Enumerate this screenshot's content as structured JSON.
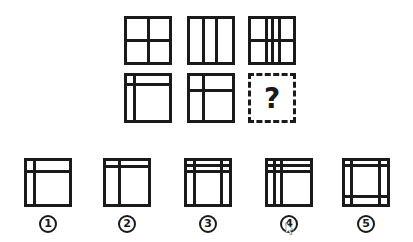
{
  "puzzle": {
    "question_mark": "?",
    "grid": [
      {
        "id": "r1c1",
        "box": [
          124,
          16,
          48,
          49
        ],
        "vlines": [
          0.5
        ],
        "hlines": [
          0.5
        ]
      },
      {
        "id": "r1c2",
        "box": [
          187,
          16,
          48,
          49
        ],
        "vlines": [
          0.33,
          0.64
        ],
        "hlines": []
      },
      {
        "id": "r1c3",
        "box": [
          248,
          16,
          48,
          49
        ],
        "vlines": [
          0.37,
          0.52,
          0.68
        ],
        "hlines": [
          0.5
        ]
      },
      {
        "id": "r2c1",
        "box": [
          124,
          73,
          48,
          50
        ],
        "vlines": [
          0.17
        ],
        "hlines": [
          0.2
        ]
      },
      {
        "id": "r2c2",
        "box": [
          187,
          73,
          48,
          50
        ],
        "vlines": [
          0.33
        ],
        "hlines": [
          0.32
        ]
      },
      {
        "id": "r2c3",
        "box": [
          248,
          73,
          48,
          50
        ],
        "unknown": true
      }
    ]
  },
  "options": [
    {
      "label": "1",
      "box": [
        24,
        158,
        48,
        49
      ],
      "vlines": [
        0.18
      ],
      "hlines": [
        0.24
      ]
    },
    {
      "label": "2",
      "box": [
        103,
        158,
        48,
        49
      ],
      "vlines": [
        0.31
      ],
      "hlines": [
        0.12
      ]
    },
    {
      "label": "3",
      "box": [
        184,
        158,
        48,
        49
      ],
      "vlines": [
        0.18,
        0.82
      ],
      "hlines": [
        0.1,
        0.24
      ]
    },
    {
      "label": "4",
      "box": [
        265,
        158,
        48,
        49
      ],
      "vlines": [
        0.16,
        0.33
      ],
      "hlines": [
        0.1,
        0.24
      ]
    },
    {
      "label": "5",
      "box": [
        342,
        158,
        48,
        49
      ],
      "vlines": [
        0.16,
        0.83
      ],
      "hlines": [
        0.1,
        0.82
      ]
    }
  ],
  "option_labels": [
    "①",
    "②",
    "③",
    "④",
    "⑤"
  ],
  "colors": {
    "line": "#1a1a1a",
    "background": "#ffffff"
  }
}
